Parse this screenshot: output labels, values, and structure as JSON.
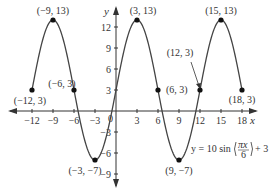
{
  "chart_data": {
    "type": "line",
    "title": "",
    "function_label": "y = 10 sin(πx/6) + 3",
    "xlabel": "x",
    "ylabel": "y",
    "xlim": [
      -13.5,
      20
    ],
    "ylim": [
      -10.5,
      15
    ],
    "x_ticks": [
      -12,
      -9,
      -6,
      -3,
      0,
      3,
      6,
      9,
      12,
      15,
      18
    ],
    "x_tick_labels": [
      "−12",
      "−9",
      "−6",
      "−3",
      "",
      "3",
      "6",
      "9",
      "12",
      "15",
      "18"
    ],
    "y_ticks": [
      12,
      9,
      6,
      3,
      -3,
      -6,
      -9
    ],
    "y_tick_labels": [
      "12",
      "9",
      "6",
      "3",
      "−3",
      "−6",
      "−9"
    ],
    "origin_label": "0",
    "grid": false,
    "legend": "none",
    "series": [
      {
        "name": "y = 10 sin(πx/6) + 3",
        "x_range": [
          -12,
          18
        ],
        "amplitude": 10,
        "period": 12,
        "vertical_shift": 3
      }
    ],
    "points": [
      {
        "x": -12,
        "y": 3,
        "label": "(−12, 3)"
      },
      {
        "x": -9,
        "y": 13,
        "label": "(−9, 13)"
      },
      {
        "x": -6,
        "y": 3,
        "label": "(−6, 3)"
      },
      {
        "x": -3,
        "y": -7,
        "label": "(−3, −7)"
      },
      {
        "x": 3,
        "y": 13,
        "label": "(3, 13)"
      },
      {
        "x": 6,
        "y": 3,
        "label": "(6, 3)"
      },
      {
        "x": 9,
        "y": -7,
        "label": "(9, −7)"
      },
      {
        "x": 12,
        "y": 3,
        "label": "(12, 3)"
      },
      {
        "x": 15,
        "y": 13,
        "label": "(15, 13)"
      },
      {
        "x": 18,
        "y": 3,
        "label": "(18, 3)"
      }
    ]
  }
}
